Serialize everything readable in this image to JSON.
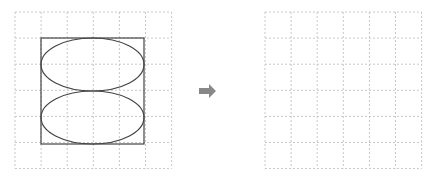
{
  "diagram": {
    "type": "grid-transformation-puzzle",
    "source_panel": {
      "grid": {
        "cols": 6,
        "rows": 6,
        "x": 15,
        "y": 12,
        "cell": 26.1,
        "line_color": "#c8c8c8"
      },
      "shapes": [
        {
          "kind": "square",
          "x": 41,
          "y": 38,
          "width": 103,
          "height": 106,
          "stroke": "#444444"
        },
        {
          "kind": "ellipse",
          "cx": 92.5,
          "cy": 64.5,
          "rx": 51.5,
          "ry": 26.5,
          "stroke": "#444444"
        },
        {
          "kind": "ellipse",
          "cx": 92.5,
          "cy": 117.5,
          "rx": 51.5,
          "ry": 26.5,
          "stroke": "#444444"
        }
      ]
    },
    "arrow": {
      "direction": "right",
      "color": "#888888",
      "x": 207,
      "y": 91
    },
    "target_panel": {
      "grid": {
        "cols": 6,
        "rows": 6,
        "x": 265,
        "y": 12,
        "cell": 26.1,
        "line_color": "#c8c8c8"
      },
      "shapes": []
    }
  }
}
